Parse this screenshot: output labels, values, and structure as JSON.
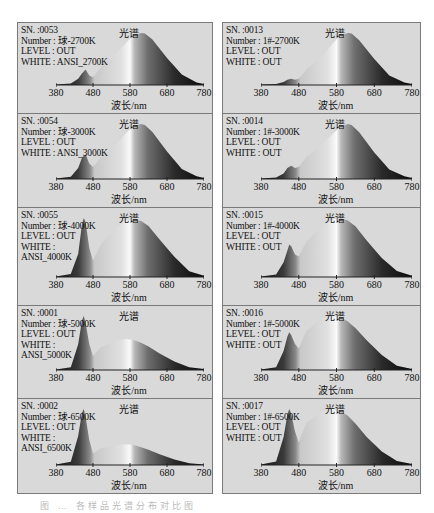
{
  "figure": {
    "caption": "图 … 各样品光谱分布对比图",
    "panel_title": "光谱",
    "x_axis_label": "波长/nm",
    "x_ticks": [
      "380",
      "480",
      "580",
      "680",
      "780"
    ]
  },
  "chart_data": [
    {
      "type": "area",
      "column": "left",
      "row": 0,
      "title": "光谱",
      "xlabel": "波长/nm",
      "xlim": [
        380,
        780
      ],
      "info": {
        "sn": "SN. :0053",
        "number": "Number : 球-2700K",
        "level": "LEVEL : OUT",
        "white": "WHITE : ANSI_2700K"
      },
      "x": [
        380,
        420,
        440,
        450,
        460,
        470,
        480,
        500,
        540,
        570,
        590,
        610,
        620,
        640,
        680,
        720,
        760,
        780
      ],
      "values": [
        0.01,
        0.03,
        0.12,
        0.22,
        0.3,
        0.18,
        0.15,
        0.33,
        0.6,
        0.82,
        0.95,
        1.0,
        0.99,
        0.88,
        0.52,
        0.2,
        0.05,
        0.02
      ]
    },
    {
      "type": "area",
      "column": "right",
      "row": 0,
      "title": "光谱",
      "xlabel": "波长/nm",
      "xlim": [
        380,
        780
      ],
      "info": {
        "sn": "SN. :0013",
        "number": "Number : 1#-2700K",
        "level": "LEVEL : OUT",
        "white": "WHITE : OUT"
      },
      "x": [
        380,
        420,
        440,
        450,
        460,
        470,
        480,
        500,
        540,
        570,
        590,
        610,
        620,
        640,
        680,
        720,
        760,
        780
      ],
      "values": [
        0.01,
        0.02,
        0.06,
        0.1,
        0.12,
        0.1,
        0.12,
        0.3,
        0.55,
        0.8,
        0.95,
        1.0,
        0.99,
        0.86,
        0.5,
        0.18,
        0.05,
        0.02
      ]
    },
    {
      "type": "area",
      "column": "left",
      "row": 1,
      "title": "光谱",
      "xlabel": "波长/nm",
      "xlim": [
        380,
        780
      ],
      "info": {
        "sn": "SN. :0054",
        "number": "Number : 球-3000K",
        "level": "LEVEL : OUT",
        "white": "WHITE : ANSI_3000K"
      },
      "x": [
        380,
        420,
        440,
        450,
        460,
        470,
        480,
        500,
        540,
        570,
        590,
        610,
        620,
        640,
        680,
        720,
        760,
        780
      ],
      "values": [
        0.01,
        0.04,
        0.2,
        0.38,
        0.45,
        0.28,
        0.22,
        0.38,
        0.62,
        0.84,
        0.96,
        1.0,
        0.98,
        0.86,
        0.5,
        0.18,
        0.05,
        0.02
      ]
    },
    {
      "type": "area",
      "column": "right",
      "row": 1,
      "title": "光谱",
      "xlabel": "波长/nm",
      "xlim": [
        380,
        780
      ],
      "info": {
        "sn": "SN. :0014",
        "number": "Number : 1#-3000K",
        "level": "LEVEL : OUT",
        "white": "WHITE : OUT"
      },
      "x": [
        380,
        420,
        440,
        450,
        460,
        470,
        480,
        500,
        540,
        570,
        590,
        610,
        620,
        640,
        680,
        720,
        760,
        780
      ],
      "values": [
        0.01,
        0.03,
        0.1,
        0.2,
        0.24,
        0.2,
        0.22,
        0.4,
        0.62,
        0.82,
        0.95,
        1.0,
        0.98,
        0.85,
        0.48,
        0.17,
        0.05,
        0.02
      ]
    },
    {
      "type": "area",
      "column": "left",
      "row": 2,
      "title": "光谱",
      "xlabel": "波长/nm",
      "xlim": [
        380,
        780
      ],
      "info": {
        "sn": "SN. :0055",
        "number": "Number : 球-4000K",
        "level": "LEVEL : OUT",
        "white": "WHITE :",
        "white2": "ANSI_4000K"
      },
      "x": [
        380,
        420,
        440,
        450,
        455,
        460,
        470,
        480,
        500,
        540,
        570,
        590,
        610,
        630,
        660,
        700,
        740,
        780
      ],
      "values": [
        0.01,
        0.05,
        0.4,
        0.9,
        1.02,
        0.95,
        0.5,
        0.28,
        0.55,
        0.85,
        0.98,
        1.0,
        0.97,
        0.88,
        0.65,
        0.35,
        0.1,
        0.02
      ]
    },
    {
      "type": "area",
      "column": "right",
      "row": 2,
      "title": "光谱",
      "xlabel": "波长/nm",
      "xlim": [
        380,
        780
      ],
      "info": {
        "sn": "SN. :0015",
        "number": "Number : 1#-4000K",
        "level": "LEVEL : OUT",
        "white": "WHITE : OUT"
      },
      "x": [
        380,
        420,
        440,
        450,
        455,
        460,
        470,
        480,
        500,
        540,
        570,
        590,
        610,
        630,
        660,
        700,
        740,
        780
      ],
      "values": [
        0.01,
        0.04,
        0.25,
        0.45,
        0.55,
        0.52,
        0.38,
        0.35,
        0.6,
        0.86,
        0.98,
        1.0,
        0.96,
        0.86,
        0.62,
        0.32,
        0.1,
        0.02
      ]
    },
    {
      "type": "area",
      "column": "left",
      "row": 3,
      "title": "光谱",
      "xlabel": "波长/nm",
      "xlim": [
        380,
        780
      ],
      "info": {
        "sn": "SN. :0001",
        "number": "Number : 球-5000K",
        "level": "LEVEL : OUT",
        "white": "WHITE :",
        "white2": "ANSI_5000K"
      },
      "x": [
        380,
        420,
        440,
        450,
        455,
        460,
        470,
        480,
        500,
        540,
        570,
        590,
        610,
        630,
        660,
        700,
        740,
        780
      ],
      "values": [
        0.01,
        0.06,
        0.55,
        1.05,
        1.15,
        1.0,
        0.55,
        0.3,
        0.48,
        0.62,
        0.66,
        0.64,
        0.58,
        0.5,
        0.35,
        0.18,
        0.06,
        0.02
      ]
    },
    {
      "type": "area",
      "column": "right",
      "row": 3,
      "title": "光谱",
      "xlabel": "波长/nm",
      "xlim": [
        380,
        780
      ],
      "info": {
        "sn": "SN. :0016",
        "number": "Number : 1#-5000K",
        "level": "LEVEL : OUT",
        "white": "WHITE : OUT"
      },
      "x": [
        380,
        420,
        440,
        450,
        455,
        460,
        470,
        480,
        500,
        540,
        570,
        590,
        610,
        630,
        660,
        700,
        740,
        780
      ],
      "values": [
        0.01,
        0.05,
        0.35,
        0.62,
        0.7,
        0.65,
        0.48,
        0.4,
        0.72,
        0.95,
        1.0,
        0.98,
        0.9,
        0.78,
        0.55,
        0.28,
        0.08,
        0.02
      ]
    },
    {
      "type": "area",
      "column": "left",
      "row": 4,
      "title": "光谱",
      "xlabel": "波长/nm",
      "xlim": [
        380,
        780
      ],
      "info": {
        "sn": "SN. :0002",
        "number": "Number : 球-6500K",
        "level": "LEVEL : OUT",
        "white": "WHITE :",
        "white2": "ANSI_6500K"
      },
      "x": [
        380,
        420,
        440,
        450,
        455,
        460,
        470,
        480,
        500,
        540,
        570,
        590,
        610,
        630,
        660,
        700,
        740,
        780
      ],
      "values": [
        0.01,
        0.08,
        0.7,
        1.25,
        1.35,
        1.15,
        0.6,
        0.28,
        0.4,
        0.48,
        0.5,
        0.48,
        0.43,
        0.37,
        0.26,
        0.13,
        0.04,
        0.01
      ]
    },
    {
      "type": "area",
      "column": "right",
      "row": 4,
      "title": "光谱",
      "xlabel": "波长/nm",
      "xlim": [
        380,
        780
      ],
      "info": {
        "sn": "SN. :0017",
        "number": "Number : 1#-6500K",
        "level": "LEVEL : OUT",
        "white": "WHITE : OUT"
      },
      "x": [
        380,
        420,
        440,
        450,
        455,
        460,
        470,
        480,
        500,
        540,
        570,
        590,
        610,
        630,
        660,
        700,
        740,
        780
      ],
      "values": [
        0.01,
        0.06,
        0.5,
        0.9,
        1.0,
        0.92,
        0.6,
        0.4,
        0.75,
        0.95,
        1.0,
        0.97,
        0.88,
        0.74,
        0.5,
        0.24,
        0.07,
        0.02
      ]
    }
  ]
}
